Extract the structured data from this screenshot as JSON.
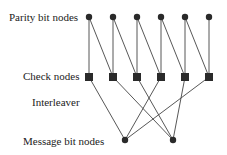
{
  "labels": {
    "parity": "Parity bit nodes",
    "check": "Check nodes",
    "interleaver": "Interleaver",
    "message": "Message bit nodes"
  },
  "parity_nodes": 6,
  "check_nodes": 6,
  "message_nodes": 2,
  "parity_to_check_edges": [
    [
      0,
      0
    ],
    [
      0,
      1
    ],
    [
      1,
      1
    ],
    [
      1,
      2
    ],
    [
      2,
      2
    ],
    [
      2,
      3
    ],
    [
      3,
      3
    ],
    [
      3,
      4
    ],
    [
      4,
      4
    ],
    [
      4,
      5
    ],
    [
      5,
      5
    ]
  ],
  "check_to_message_edges": [
    [
      0,
      0
    ],
    [
      1,
      1
    ],
    [
      2,
      1
    ],
    [
      3,
      0
    ],
    [
      4,
      1
    ],
    [
      5,
      0
    ]
  ],
  "colors": {
    "node": "#2a2a2a",
    "edge": "#444444"
  }
}
